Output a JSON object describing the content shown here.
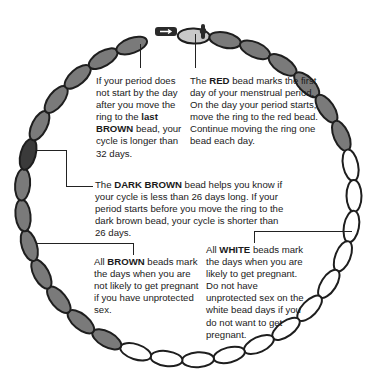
{
  "diagram": {
    "colors": {
      "brown": "#7a7a7a",
      "dark_brown": "#3a3a3a",
      "red": "#c8c8c8",
      "white": "#ffffff",
      "outline": "#1e1e1e",
      "ring": "#2a2a2a"
    },
    "ellipse": {
      "cx": 188,
      "cy": 198,
      "rx": 166,
      "ry": 162
    },
    "start_angle_deg": -88,
    "bead_count": 32,
    "beads": [
      {
        "day": 1,
        "type": "red"
      },
      {
        "day": 2,
        "type": "brown"
      },
      {
        "day": 3,
        "type": "brown"
      },
      {
        "day": 4,
        "type": "brown"
      },
      {
        "day": 5,
        "type": "brown"
      },
      {
        "day": 6,
        "type": "brown"
      },
      {
        "day": 7,
        "type": "brown"
      },
      {
        "day": 8,
        "type": "white"
      },
      {
        "day": 9,
        "type": "white"
      },
      {
        "day": 10,
        "type": "white"
      },
      {
        "day": 11,
        "type": "white"
      },
      {
        "day": 12,
        "type": "white"
      },
      {
        "day": 13,
        "type": "white"
      },
      {
        "day": 14,
        "type": "white"
      },
      {
        "day": 15,
        "type": "white"
      },
      {
        "day": 16,
        "type": "white"
      },
      {
        "day": 17,
        "type": "white"
      },
      {
        "day": 18,
        "type": "white"
      },
      {
        "day": 19,
        "type": "white"
      },
      {
        "day": 20,
        "type": "brown"
      },
      {
        "day": 21,
        "type": "brown"
      },
      {
        "day": 22,
        "type": "brown"
      },
      {
        "day": 23,
        "type": "brown"
      },
      {
        "day": 24,
        "type": "brown"
      },
      {
        "day": 25,
        "type": "brown"
      },
      {
        "day": 26,
        "type": "brown"
      },
      {
        "day": 27,
        "type": "dark_brown"
      },
      {
        "day": 28,
        "type": "brown"
      },
      {
        "day": 29,
        "type": "brown"
      },
      {
        "day": 30,
        "type": "brown"
      },
      {
        "day": 31,
        "type": "brown"
      },
      {
        "day": 32,
        "type": "brown"
      }
    ]
  },
  "notes": {
    "last_brown": {
      "pre": "If your period does not start by the day after you move the ring to the ",
      "bold": "last BROWN",
      "post": " bead, your cycle is longer than 32 days."
    },
    "red": {
      "pre": "The ",
      "bold": "RED",
      "post": " bead marks the first day of your menstrual period.  On the day your period starts, move the ring to the red bead. Continue moving the ring one bead each day."
    },
    "dark_brown": {
      "pre": "The ",
      "bold": "DARK BROWN",
      "post": " bead helps you know if your cycle is less than 26 days long.  If your period starts before you move the ring to the dark brown bead, your cycle is shorter than 26 days."
    },
    "brown": {
      "pre": "All ",
      "bold": "BROWN",
      "post": " beads mark the days when you are not likely to get pregnant if you have unprotected sex."
    },
    "white": {
      "pre": "All ",
      "bold": "WHITE",
      "post": " beads mark the days when you are likely to get pregnant. Do not have unprotected sex on the white bead days if you do not want to get pregnant."
    }
  }
}
